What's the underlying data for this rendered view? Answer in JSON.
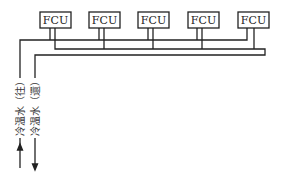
{
  "diagram": {
    "type": "piping-schematic",
    "units": [
      {
        "label": "FCU",
        "x": 40
      },
      {
        "label": "FCU",
        "x": 89
      },
      {
        "label": "FCU",
        "x": 138
      },
      {
        "label": "FCU",
        "x": 188
      },
      {
        "label": "FCU",
        "x": 238
      }
    ],
    "pipes": {
      "supply": {
        "label": "冷温水（往）",
        "direction": "up"
      },
      "return": {
        "label": "冷温水（還）",
        "direction": "down"
      }
    },
    "colors": {
      "line": "#222222",
      "background": "#ffffff"
    }
  }
}
